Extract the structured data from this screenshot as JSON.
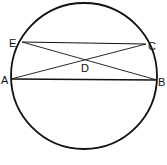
{
  "figure": {
    "caption": "Fig. 10",
    "circle": {
      "cx": 84,
      "cy": 76,
      "r": 73
    },
    "points": {
      "E": {
        "label": "E",
        "x": 22,
        "y": 42
      },
      "C": {
        "label": "C",
        "x": 146,
        "y": 44
      },
      "A": {
        "label": "A",
        "x": 11,
        "y": 79
      },
      "B": {
        "label": "B",
        "x": 157,
        "y": 80
      },
      "D": {
        "label": "D",
        "x": 84,
        "y": 61
      }
    },
    "segments": [
      "EC",
      "AB",
      "EB",
      "AC"
    ],
    "stroke_color": "#111111"
  }
}
